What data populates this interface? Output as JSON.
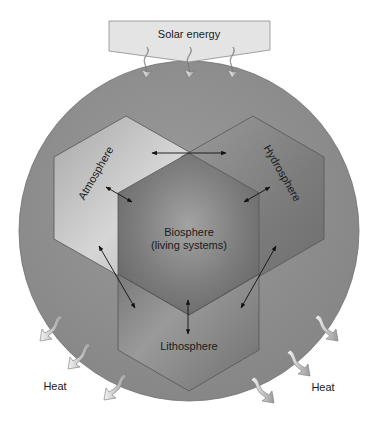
{
  "solar_box": {
    "label": "Solar energy"
  },
  "spheres": {
    "atmosphere": {
      "label": "Atmosphere"
    },
    "hydrosphere": {
      "label": "Hydrosphere"
    },
    "biosphere": {
      "label_line1": "Biosphere",
      "label_line2": "(living systems)"
    },
    "lithosphere": {
      "label": "Lithosphere"
    }
  },
  "heat_labels": {
    "left": "Heat",
    "right": "Heat"
  },
  "colors": {
    "earth_circle": "#8e8e8e",
    "atmosphere": "#b9b9b9",
    "hydrosphere": "#7d7d7d",
    "biosphere": "#7a7a7a",
    "lithosphere": "#7c7c7c",
    "solar_box": "#e2e2e2",
    "arrow": "#111111"
  },
  "interactions": [
    "atmosphere-hydrosphere",
    "atmosphere-biosphere",
    "hydrosphere-biosphere",
    "atmosphere-lithosphere",
    "hydrosphere-lithosphere",
    "biosphere-lithosphere"
  ]
}
